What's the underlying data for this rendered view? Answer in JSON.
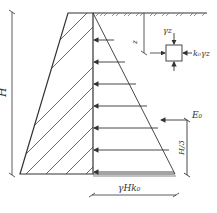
{
  "diagram": {
    "labels": {
      "height": "H",
      "depth": "z",
      "vertical_stress": "γz",
      "horizontal_stress": "k₀γz",
      "resultant": "E₀",
      "resultant_height": "H/3",
      "base_pressure": "γHk₀"
    },
    "arrow_rows_y": [
      40,
      62,
      84,
      106,
      128,
      150,
      172
    ],
    "colors": {
      "line": "#333333",
      "hatch": "#444444",
      "background": "#ffffff"
    }
  }
}
